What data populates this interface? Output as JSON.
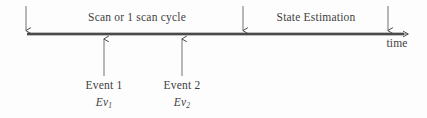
{
  "diagram": {
    "type": "timeline",
    "axis": {
      "label": "time",
      "label_x": 397,
      "label_y": 38,
      "line_y": 34,
      "x_start": 27,
      "x_end": 412,
      "color": "#4a4a4a"
    },
    "phases": [
      {
        "id": "scan",
        "label": "Scan or 1 scan cycle",
        "center_x": 137,
        "label_y": 12
      },
      {
        "id": "state-estimation",
        "label": "State Estimation",
        "center_x": 316,
        "label_y": 12
      }
    ],
    "boundary_markers": [
      {
        "id": "marker-start",
        "x": 26,
        "y_top": 6
      },
      {
        "id": "marker-mid",
        "x": 243,
        "y_top": 6
      },
      {
        "id": "marker-end",
        "x": 388,
        "y_top": 6
      }
    ],
    "events": [
      {
        "id": "event-1",
        "name": "Event 1",
        "symbol": "Ev",
        "subscript": "1",
        "x": 104,
        "tail_y": 76,
        "name_y": 80,
        "symbol_y": 97
      },
      {
        "id": "event-2",
        "name": "Event 2",
        "symbol": "Ev",
        "subscript": "2",
        "x": 182,
        "tail_y": 76,
        "name_y": 80,
        "symbol_y": 97
      }
    ]
  }
}
